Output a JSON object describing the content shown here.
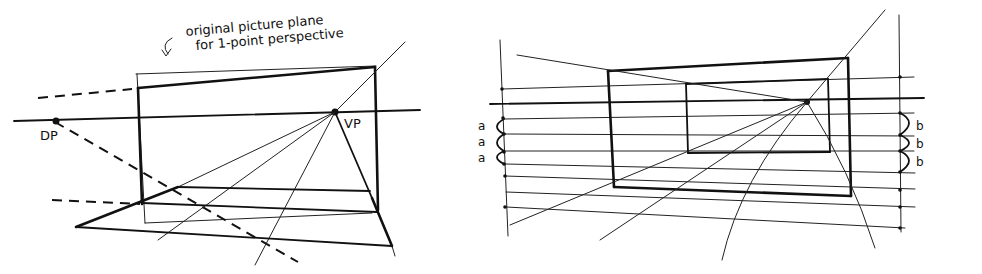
{
  "left_figure": {
    "annotation_line1": "original picture plane",
    "annotation_line2": "for 1-point perspective",
    "dp_label": "DP",
    "vp_label": "VP"
  },
  "right_figure": {
    "left_labels": [
      "a",
      "a",
      "a"
    ],
    "right_labels": [
      "b",
      "b",
      "b"
    ]
  }
}
